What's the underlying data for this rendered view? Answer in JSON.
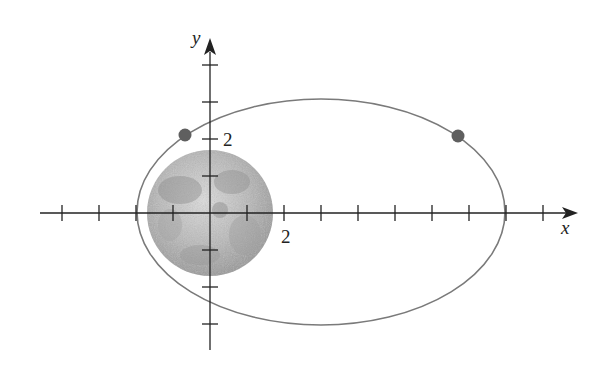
{
  "diagram": {
    "unit_px": 37,
    "origin_px": [
      210,
      213
    ],
    "axes": {
      "x_label": "x",
      "y_label": "y",
      "x_ticks": [
        -4,
        -3,
        -2,
        -1,
        1,
        2,
        3,
        4,
        5,
        6,
        7,
        8,
        9
      ],
      "y_ticks": [
        -3,
        -2,
        -1,
        1,
        2,
        3,
        4
      ],
      "x_tick_label": "2",
      "y_tick_label": "2"
    },
    "ellipse": {
      "center": [
        3,
        0
      ],
      "semi_major": 5,
      "semi_minor": 3.05,
      "stroke": "#777777"
    },
    "moon": {
      "center": [
        0,
        0
      ],
      "radius": 1.72,
      "color_light": "#d8d8d8",
      "color_dark": "#8a8a8a"
    },
    "points": [
      {
        "x": -0.68,
        "y": 2.1,
        "color": "#606060"
      },
      {
        "x": 6.7,
        "y": 2.07,
        "color": "#606060"
      }
    ],
    "colors": {
      "axis": "#222222",
      "dot": "#606060"
    }
  }
}
